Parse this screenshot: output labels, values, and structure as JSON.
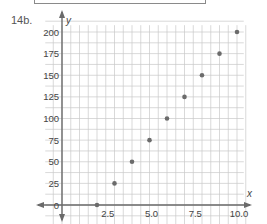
{
  "problem": {
    "label": "14b."
  },
  "chart_data": {
    "type": "scatter",
    "title": "",
    "xlabel": "x",
    "ylabel": "y",
    "x": [
      1,
      2,
      3,
      4,
      5,
      6,
      7,
      8,
      9,
      10
    ],
    "y": [
      -25,
      0,
      25,
      50,
      75,
      100,
      125,
      150,
      175,
      200
    ],
    "xlim": [
      -0.5,
      10.5
    ],
    "ylim": [
      -37.5,
      212.5
    ],
    "x_ticks": [
      "2.5",
      "5.0",
      "7.5",
      "10.0"
    ],
    "y_ticks": [
      "200",
      "175",
      "150",
      "125",
      "100",
      "75",
      "50",
      "25",
      "0",
      "-25"
    ],
    "grid": true,
    "legend": null
  },
  "colors": {
    "grid": "#c8c8c8",
    "axis": "#6a6a6a",
    "point": "#6b6b6b"
  }
}
